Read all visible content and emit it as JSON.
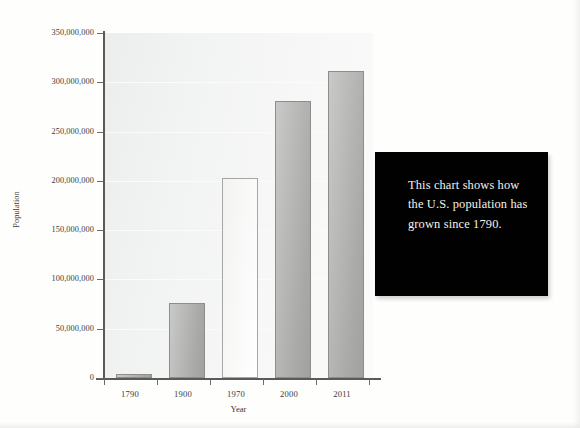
{
  "chart_data": {
    "type": "bar",
    "title": "",
    "xlabel": "Year",
    "ylabel": "Population",
    "categories": [
      "1790",
      "1900",
      "1970",
      "2000",
      "2011"
    ],
    "values": [
      3929214,
      76212168,
      203211926,
      281421906,
      311591917
    ],
    "value_labels": [
      "3,929,214",
      "76,212,168",
      "203,211,926",
      "281,421,906",
      "311,591,917"
    ],
    "ylim": [
      0,
      350000000
    ],
    "xlim_note": "categorical",
    "ytick_values": [
      0,
      50000000,
      100000000,
      150000000,
      200000000,
      250000000,
      300000000,
      350000000
    ],
    "ytick_labels": [
      "0",
      "50,000,000",
      "100,000,000",
      "150,000,000",
      "200,000,000",
      "250,000,000",
      "300,000,000",
      "350,000,000"
    ],
    "grid": true,
    "legend": "none",
    "series_styles": [
      "dark",
      "dark",
      "light",
      "dark",
      "dark"
    ]
  },
  "callout": {
    "text": "This chart shows how the U.S. population has grown since 1790.",
    "background_color": "#010101",
    "text_color": "#f4f2ee"
  },
  "colors": {
    "plot_background": "#f2f3f3",
    "bar_dark": "#b5b5b3",
    "bar_light": "#f8f8f7",
    "bar_border": "#8d8d8b",
    "axis": "#5a5a58",
    "text": "#3a3a38",
    "page_background": "#fefefd"
  }
}
